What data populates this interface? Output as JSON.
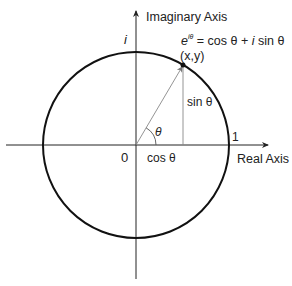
{
  "diagram": {
    "axes": {
      "vertical_label": "Imaginary Axis",
      "horizontal_label": "Real Axis"
    },
    "labels": {
      "imag_unit": "i",
      "origin": "0",
      "one": "1",
      "theta": "θ",
      "point": "(x,y)",
      "cos": "cos θ",
      "sin": "sin θ",
      "formula_base": "e",
      "formula_exp": "iθ",
      "formula_rhs_1": " = cos θ + ",
      "formula_rhs_i": "i",
      "formula_rhs_2": " sin θ"
    },
    "geometry": {
      "origin": [
        136,
        145
      ],
      "radius": 93,
      "point": [
        183,
        65
      ],
      "angle_deg": 59.6
    },
    "colors": {
      "circle": "#111111",
      "axes": "#222222",
      "vector": "#888888",
      "text": "#222222"
    }
  }
}
